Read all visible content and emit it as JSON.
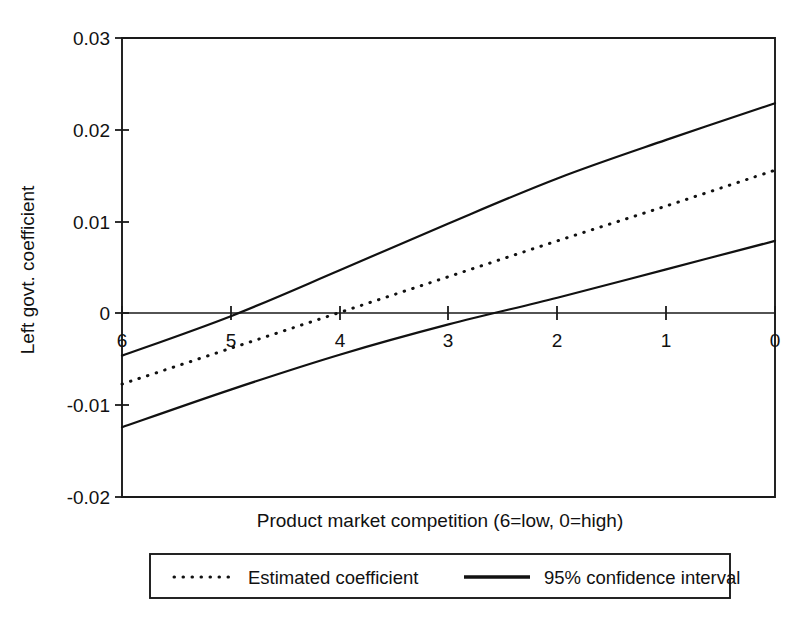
{
  "chart_data": {
    "type": "line",
    "title": "",
    "xlabel": "Product market competition (6=low, 0=high)",
    "ylabel": "Left govt. coefficient",
    "xlim": [
      6,
      0
    ],
    "ylim": [
      -0.02,
      0.03
    ],
    "x_ticks": [
      6,
      5,
      4,
      3,
      2,
      1,
      0
    ],
    "x_tick_labels": [
      "6",
      "5",
      "4",
      "3",
      "2",
      "1",
      "0"
    ],
    "y_ticks": [
      0.03,
      0.02,
      0.01,
      0,
      -0.01,
      -0.02
    ],
    "y_tick_labels": [
      "0.03",
      "0.02",
      "0.01",
      "0",
      "-0.01",
      "-0.02"
    ],
    "grid": false,
    "x_axis_inverted": true,
    "zero_reference_line": true,
    "legend_position": "below-axis",
    "series": [
      {
        "name": "Estimated coefficient",
        "style": "dotted",
        "x": [
          6,
          5,
          4,
          3,
          2,
          1,
          0
        ],
        "values": [
          -0.0077,
          -0.0038,
          0.0001,
          0.004,
          0.0079,
          0.0117,
          0.0156
        ]
      },
      {
        "name": "95% confidence interval upper",
        "style": "solid",
        "x": [
          6,
          5,
          4,
          3,
          2,
          1,
          0
        ],
        "values": [
          -0.0046,
          -0.0003,
          0.0047,
          0.0098,
          0.0147,
          0.0189,
          0.0229
        ]
      },
      {
        "name": "95% confidence interval lower",
        "style": "solid",
        "x": [
          6,
          5,
          4,
          3,
          2,
          1,
          0
        ],
        "values": [
          -0.0124,
          -0.0083,
          -0.0045,
          -0.0012,
          0.0017,
          0.0048,
          0.0079
        ]
      }
    ],
    "legend_entries": [
      {
        "label": "Estimated coefficient",
        "style": "dotted"
      },
      {
        "label": "95% confidence interval",
        "style": "solid"
      }
    ],
    "annotations": []
  },
  "axes": {
    "y_label": "Left govt. coefficient",
    "x_label": "Product market competition (6=low, 0=high)",
    "y_tick_0": "0.03",
    "y_tick_1": "0.02",
    "y_tick_2": "0.01",
    "y_tick_3": "0",
    "y_tick_4": "-0.01",
    "y_tick_5": "-0.02",
    "x_tick_0": "6",
    "x_tick_1": "5",
    "x_tick_2": "4",
    "x_tick_3": "3",
    "x_tick_4": "2",
    "x_tick_5": "1",
    "x_tick_6": "0"
  },
  "legend": {
    "estimated_label": "Estimated coefficient",
    "confidence_label": "95% confidence interval"
  },
  "colors": {
    "ink": "#111111",
    "frame": "#1a1a1a",
    "background": "#ffffff"
  }
}
